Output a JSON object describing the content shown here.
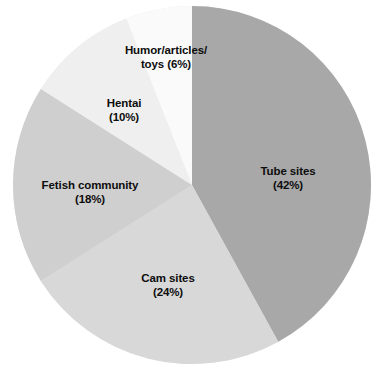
{
  "chart_data": {
    "type": "pie",
    "title": "",
    "subtitle": "",
    "xlabel": "",
    "ylabel": "",
    "legend_position": "none",
    "grid": false,
    "units": "percent",
    "total": 100,
    "start_angle_deg": 0,
    "direction": "clockwise",
    "categories": [
      "Tube sites",
      "Cam sites",
      "Fetish community",
      "Hentai",
      "Humor/articles/toys"
    ],
    "values": [
      42,
      24,
      18,
      10,
      6
    ],
    "slices": [
      {
        "name": "Tube sites",
        "value": 42,
        "label_line1": "Tube sites",
        "label_line2": "(42%)",
        "color": "#a8a8a8",
        "label_x": 288,
        "label_y": 178
      },
      {
        "name": "Cam sites",
        "value": 24,
        "label_line1": "Cam sites",
        "label_line2": "(24%)",
        "color": "#d8d8d8",
        "label_x": 168,
        "label_y": 285
      },
      {
        "name": "Fetish community",
        "value": 18,
        "label_line1": "Fetish community",
        "label_line2": "(18%)",
        "color": "#cfcfcf",
        "label_x": 90,
        "label_y": 192
      },
      {
        "name": "Hentai",
        "value": 10,
        "label_line1": "Hentai",
        "label_line2": "(10%)",
        "color": "#efefef",
        "label_x": 124,
        "label_y": 110
      },
      {
        "name": "Humor/articles/toys",
        "value": 6,
        "label_line1": "Humor/articles/",
        "label_line2": "toys (6%)",
        "color": "#fafafa",
        "label_x": 166,
        "label_y": 57
      }
    ],
    "geometry": {
      "center_x": 192,
      "center_y": 185,
      "radius": 179
    },
    "background_color": "#ffffff",
    "label_color": "#0d0d0d"
  }
}
